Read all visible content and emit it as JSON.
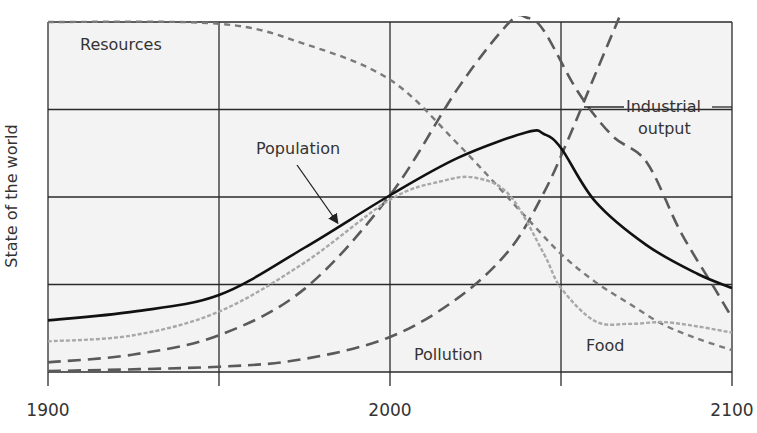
{
  "chart_data": {
    "type": "line",
    "title": "",
    "xlabel": "",
    "ylabel": "State of the world",
    "xlim": [
      1900,
      2100
    ],
    "ylim": [
      0,
      4
    ],
    "x_ticks": [
      1900,
      2000,
      2100
    ],
    "grid": {
      "vertical_years": [
        1900,
        1950,
        2000,
        2050,
        2100
      ],
      "horizontal_levels": [
        0,
        1,
        2,
        3,
        4
      ],
      "on": true
    },
    "legend": "none (inline labels)",
    "series": [
      {
        "name": "Population",
        "style": "solid",
        "color": "#111111",
        "x": [
          1900,
          1925,
          1950,
          1975,
          2000,
          2020,
          2040,
          2045,
          2050,
          2060,
          2075,
          2090,
          2100
        ],
        "values": [
          0.59,
          0.69,
          0.88,
          1.42,
          2.02,
          2.45,
          2.74,
          2.72,
          2.56,
          1.95,
          1.45,
          1.12,
          0.96
        ]
      },
      {
        "name": "Food",
        "style": "dotted",
        "color": "#a8a8a8",
        "x": [
          1900,
          1925,
          1950,
          1975,
          2000,
          2015,
          2025,
          2035,
          2045,
          2050,
          2060,
          2070,
          2080,
          2090,
          2100
        ],
        "values": [
          0.35,
          0.42,
          0.69,
          1.25,
          1.97,
          2.18,
          2.22,
          2.02,
          1.35,
          0.96,
          0.58,
          0.55,
          0.57,
          0.52,
          0.45
        ]
      },
      {
        "name": "Industrial output",
        "style": "dashed",
        "color": "#5a5a5a",
        "x": [
          1900,
          1925,
          1950,
          1975,
          2000,
          2020,
          2035,
          2040,
          2045,
          2055,
          2065,
          2075,
          2085,
          2095,
          2100
        ],
        "values": [
          0.11,
          0.2,
          0.42,
          0.95,
          2.02,
          3.25,
          4.0,
          4.05,
          3.9,
          3.2,
          2.7,
          2.4,
          1.6,
          0.95,
          0.62
        ]
      },
      {
        "name": "Pollution",
        "style": "dashed",
        "color": "#5a5a5a",
        "x": [
          1900,
          1950,
          1975,
          2000,
          2020,
          2035,
          2045,
          2052,
          2060,
          2067
        ],
        "values": [
          0.01,
          0.06,
          0.15,
          0.4,
          0.85,
          1.4,
          2.05,
          2.65,
          3.4,
          4.05
        ]
      },
      {
        "name": "Resources",
        "style": "dotted",
        "color": "#7a7a7a",
        "x": [
          1900,
          1950,
          1975,
          2000,
          2020,
          2040,
          2050,
          2060,
          2070,
          2080,
          2090,
          2100
        ],
        "values": [
          4.0,
          3.98,
          3.75,
          3.34,
          2.6,
          1.76,
          1.35,
          1.03,
          0.78,
          0.54,
          0.38,
          0.25
        ]
      }
    ],
    "annotations": [
      {
        "text": "Resources",
        "x": 1911,
        "y": 3.75
      },
      {
        "text": "Population",
        "x": 1960,
        "y": 2.5,
        "arrow_to": {
          "x": 1983,
          "y": 1.6
        }
      },
      {
        "text": "Industrial output",
        "x": 2086,
        "y": 2.8,
        "leader_lines": true
      },
      {
        "text": "Pollution",
        "x": 2015,
        "y": 0.2
      },
      {
        "text": "Food",
        "x": 2062,
        "y": 0.25
      }
    ]
  },
  "labels": {
    "ylabel": "State of the world",
    "resources": "Resources",
    "population": "Population",
    "industrial_line1": "Industrial",
    "industrial_line2": "output",
    "pollution": "Pollution",
    "food": "Food",
    "tick_1900": "1900",
    "tick_2000": "2000",
    "tick_2100": "2100"
  },
  "colors": {
    "plot_background": "#f3f3f3",
    "grid": "#2a2a2a",
    "text": "#333333"
  }
}
